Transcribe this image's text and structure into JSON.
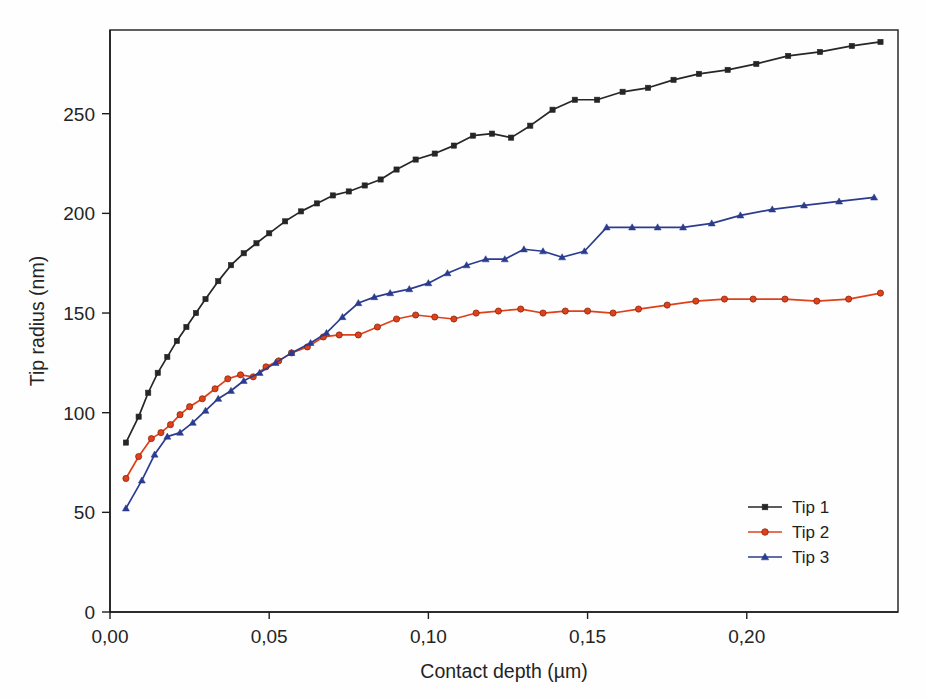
{
  "chart_data": {
    "type": "line",
    "title": "",
    "xlabel": "Contact depth (µm)",
    "ylabel": "Tip radius (nm)",
    "xlim": [
      0.0,
      0.2475
    ],
    "ylim": [
      0,
      292
    ],
    "xticks": [
      0.0,
      0.05,
      0.1,
      0.15,
      0.2
    ],
    "xticklabels": [
      "0,00",
      "0,05",
      "0,10",
      "0,15",
      "0,20"
    ],
    "yticks": [
      0,
      50,
      100,
      150,
      200,
      250
    ],
    "yticklabels": [
      "0",
      "50",
      "100",
      "150",
      "200",
      "250"
    ],
    "grid": false,
    "legend_position": "lower right",
    "decimal_separator": ",",
    "series": [
      {
        "name": "Tip 1",
        "color": "#262626",
        "marker": "square",
        "x": [
          0.005,
          0.009,
          0.012,
          0.015,
          0.018,
          0.021,
          0.024,
          0.027,
          0.03,
          0.034,
          0.038,
          0.042,
          0.046,
          0.05,
          0.055,
          0.06,
          0.065,
          0.07,
          0.075,
          0.08,
          0.085,
          0.09,
          0.096,
          0.102,
          0.108,
          0.114,
          0.12,
          0.126,
          0.132,
          0.139,
          0.146,
          0.153,
          0.161,
          0.169,
          0.177,
          0.185,
          0.194,
          0.203,
          0.213,
          0.223,
          0.233,
          0.242
        ],
        "y": [
          85,
          98,
          110,
          120,
          128,
          136,
          143,
          150,
          157,
          166,
          174,
          180,
          185,
          190,
          196,
          201,
          205,
          209,
          211,
          214,
          217,
          222,
          227,
          230,
          234,
          239,
          240,
          238,
          244,
          252,
          257,
          257,
          261,
          263,
          267,
          270,
          272,
          275,
          279,
          281,
          284,
          286
        ]
      },
      {
        "name": "Tip 2",
        "color": "#e0401a",
        "marker": "circle",
        "x": [
          0.005,
          0.009,
          0.013,
          0.016,
          0.019,
          0.022,
          0.025,
          0.029,
          0.033,
          0.037,
          0.041,
          0.045,
          0.049,
          0.053,
          0.057,
          0.062,
          0.067,
          0.072,
          0.078,
          0.084,
          0.09,
          0.096,
          0.102,
          0.108,
          0.115,
          0.122,
          0.129,
          0.136,
          0.143,
          0.15,
          0.158,
          0.166,
          0.175,
          0.184,
          0.193,
          0.202,
          0.212,
          0.222,
          0.232,
          0.242
        ],
        "y": [
          67,
          78,
          87,
          90,
          94,
          99,
          103,
          107,
          112,
          117,
          119,
          118,
          123,
          126,
          130,
          133,
          138,
          139,
          139,
          143,
          147,
          149,
          148,
          147,
          150,
          151,
          152,
          150,
          151,
          151,
          150,
          152,
          154,
          156,
          157,
          157,
          157,
          156,
          157,
          160
        ]
      },
      {
        "name": "Tip 3",
        "color": "#2b3c8e",
        "marker": "triangle",
        "x": [
          0.005,
          0.01,
          0.014,
          0.018,
          0.022,
          0.026,
          0.03,
          0.034,
          0.038,
          0.042,
          0.047,
          0.052,
          0.057,
          0.063,
          0.068,
          0.073,
          0.078,
          0.083,
          0.088,
          0.094,
          0.1,
          0.106,
          0.112,
          0.118,
          0.124,
          0.13,
          0.136,
          0.142,
          0.149,
          0.156,
          0.164,
          0.172,
          0.18,
          0.189,
          0.198,
          0.208,
          0.218,
          0.229,
          0.24
        ],
        "y": [
          52,
          66,
          79,
          88,
          90,
          95,
          101,
          107,
          111,
          116,
          120,
          125,
          130,
          135,
          140,
          148,
          155,
          158,
          160,
          162,
          165,
          170,
          174,
          177,
          177,
          182,
          181,
          178,
          181,
          193,
          193,
          193,
          193,
          195,
          199,
          202,
          204,
          206,
          208
        ]
      }
    ]
  },
  "axes": {
    "x_title": "Contact depth (µm)",
    "y_title": "Tip radius (nm)",
    "x_tick_labels": [
      "0,00",
      "0,05",
      "0,10",
      "0,15",
      "0,20"
    ],
    "y_tick_labels": [
      "0",
      "50",
      "100",
      "150",
      "200",
      "250"
    ]
  },
  "legend": {
    "entries": [
      {
        "label": "Tip 1",
        "color": "#262626",
        "marker": "square"
      },
      {
        "label": "Tip 2",
        "color": "#e0401a",
        "marker": "circle"
      },
      {
        "label": "Tip 3",
        "color": "#2b3c8e",
        "marker": "triangle"
      }
    ]
  }
}
